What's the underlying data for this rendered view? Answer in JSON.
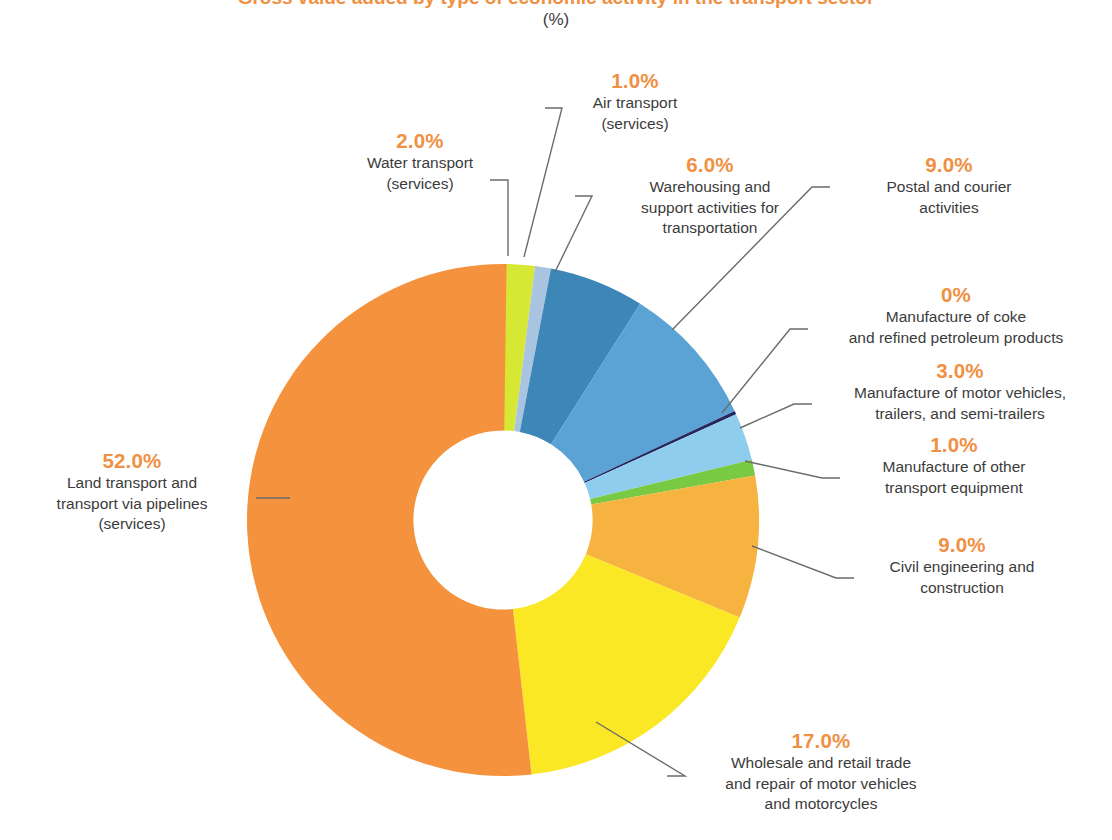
{
  "header": {
    "title": "Gross value added by type of economic activity in the transport sector",
    "subtitle": "(%)"
  },
  "colors": {
    "accent_percent": "#ef9043",
    "label_text": "#3b3b3b",
    "leader_line": "#6b6b6b",
    "background": "#ffffff"
  },
  "chart_data": {
    "type": "pie",
    "variant": "donut",
    "title": "Gross value added by type of economic activity in the transport sector",
    "subtitle": "(%)",
    "units": "%",
    "ylabel": "",
    "xlabel": "",
    "legend_position": "callout-labels",
    "grid": false,
    "start_angle_deg": 0,
    "direction": "clockwise",
    "inner_radius_ratio": 0.35,
    "categories": [
      "Water transport (services)",
      "Air transport (services)",
      "Warehousing and support activities for transportation",
      "Postal and courier activities",
      "Manufacture of coke and refined petroleum products",
      "Manufacture of motor vehicles, trailers, and semi-trailers",
      "Manufacture of other transport equipment",
      "Civil engineering and construction",
      "Wholesale and retail trade and repair of motor vehicles and motorcycles",
      "Land transport and transport via pipelines (services)"
    ],
    "values": [
      2.0,
      1.0,
      6.0,
      9.0,
      0,
      3.0,
      1.0,
      9.0,
      17.0,
      52.0
    ],
    "value_labels": [
      "2.0%",
      "1.0%",
      "6.0%",
      "9.0%",
      "0%",
      "3.0%",
      "1.0%",
      "9.0%",
      "17.0%",
      "52.0%"
    ],
    "colors": [
      "#d7e834",
      "#a8c4e0",
      "#3d87b8",
      "#5ba3d4",
      "#26275e",
      "#8fcdee",
      "#7ac943",
      "#f6b33f",
      "#fbe825",
      "#f5923e"
    ],
    "slices": [
      {
        "label": "Water transport (services)",
        "value": 2.0,
        "value_label": "2.0%",
        "color": "#d7e834"
      },
      {
        "label": "Air transport (services)",
        "value": 1.0,
        "value_label": "1.0%",
        "color": "#a8c4e0"
      },
      {
        "label": "Warehousing and support activities for transportation",
        "value": 6.0,
        "value_label": "6.0%",
        "color": "#3d87b8"
      },
      {
        "label": "Postal and courier activities",
        "value": 9.0,
        "value_label": "9.0%",
        "color": "#5ba3d4"
      },
      {
        "label": "Manufacture of coke and refined petroleum products",
        "value": 0,
        "value_label": "0%",
        "color": "#26275e"
      },
      {
        "label": "Manufacture of motor vehicles, trailers, and semi-trailers",
        "value": 3.0,
        "value_label": "3.0%",
        "color": "#8fcdee"
      },
      {
        "label": "Manufacture of other transport equipment",
        "value": 1.0,
        "value_label": "1.0%",
        "color": "#7ac943"
      },
      {
        "label": "Civil engineering and construction",
        "value": 9.0,
        "value_label": "9.0%",
        "color": "#f6b33f"
      },
      {
        "label": "Wholesale and retail trade and repair of motor vehicles and motorcycles",
        "value": 17.0,
        "value_label": "17.0%",
        "color": "#fbe825"
      },
      {
        "label": "Land transport and transport via pipelines (services)",
        "value": 52.0,
        "value_label": "52.0%",
        "color": "#f5923e"
      }
    ]
  },
  "callouts": {
    "air_transport": {
      "pct": "1.0%",
      "label": "Air transport\n(services)"
    },
    "water_transport": {
      "pct": "2.0%",
      "label": "Water transport\n(services)"
    },
    "warehousing": {
      "pct": "6.0%",
      "label": "Warehousing and\nsupport activities for\ntransportation"
    },
    "postal": {
      "pct": "9.0%",
      "label": "Postal and courier\nactivities"
    },
    "coke": {
      "pct": "0%",
      "label": "Manufacture of coke\nand refined petroleum products"
    },
    "motor_vehicles": {
      "pct": "3.0%",
      "label": "Manufacture of motor vehicles,\ntrailers, and semi-trailers"
    },
    "other_transport": {
      "pct": "1.0%",
      "label": "Manufacture of other\ntransport equipment"
    },
    "civil_engineering": {
      "pct": "9.0%",
      "label": "Civil engineering and\nconstruction"
    },
    "wholesale": {
      "pct": "17.0%",
      "label": "Wholesale and retail trade\nand repair of motor vehicles\nand motorcycles"
    },
    "land_transport": {
      "pct": "52.0%",
      "label": "Land transport and\ntransport via pipelines\n(services)"
    }
  }
}
